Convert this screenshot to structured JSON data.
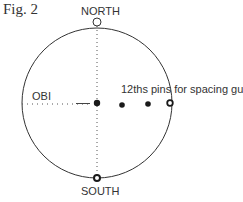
{
  "figure": {
    "label": "Fig. 2"
  },
  "labels": {
    "north": "NORTH",
    "south": "SOUTH",
    "obi": "OBI",
    "pins": "12ths pins for spacing guide"
  },
  "colors": {
    "stroke": "#333333",
    "dots": "#1a1a1a",
    "background": "#ffffff"
  },
  "geometry": {
    "circle_center": [
      97,
      103
    ],
    "circle_radius": 75,
    "pins": [
      [
        122,
        105
      ],
      [
        148,
        104
      ],
      [
        170,
        103
      ]
    ]
  }
}
